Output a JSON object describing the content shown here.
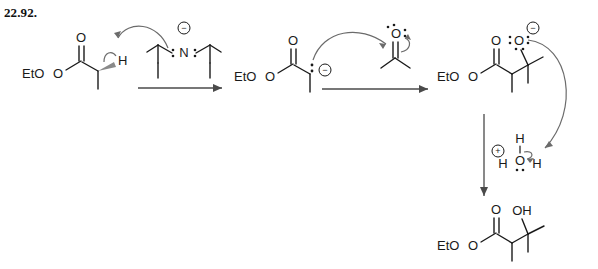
{
  "page": {
    "problem_number": "22.92.",
    "background_color": "#ffffff",
    "ink_color": "#1a1a1a",
    "arrow_color": "#6b6b6b",
    "wedge_color": "#8a8a8a"
  },
  "scheme": {
    "type": "reaction-mechanism",
    "description": "Aldol-type addition of an ester enolate to acetone followed by protonation",
    "steps": [
      {
        "id": "step-1",
        "label": "deprotonation",
        "reactant": "ethyl propanoate",
        "reagent": "LDA (lithium diisopropylamide anion)"
      },
      {
        "id": "step-2",
        "label": "nucleophilic addition",
        "reactant": "ester enolate carbanion",
        "reagent": "acetone"
      },
      {
        "id": "step-3",
        "label": "protonation",
        "reactant": "alkoxide intermediate",
        "reagent": "hydronium ion"
      }
    ]
  },
  "structures": {
    "ester_start": {
      "name": "ethyl-propanoate",
      "eto_label": "EtO",
      "carbonyl_o": "O",
      "alpha_h": "H"
    },
    "lda": {
      "name": "diisopropylamide-anion",
      "nitrogen": "N",
      "charge": "−"
    },
    "enolate": {
      "name": "ester-enolate-carbanion",
      "eto_label": "EtO",
      "carbonyl_o": "O",
      "charge": "−"
    },
    "acetone": {
      "name": "acetone",
      "carbonyl_o": "O"
    },
    "alkoxide": {
      "name": "alkoxide-intermediate",
      "eto_label": "EtO",
      "carbonyl_o": "O",
      "alkoxide_o": "O",
      "charge": "−"
    },
    "hydronium": {
      "name": "hydronium-ion",
      "oxygen": "O",
      "h_top": "H",
      "h_left": "H",
      "h_right": "H",
      "charge": "+"
    },
    "product": {
      "name": "beta-hydroxy-ester-product",
      "eto_label": "EtO",
      "carbonyl_o": "O",
      "hydroxyl": "OH"
    }
  }
}
